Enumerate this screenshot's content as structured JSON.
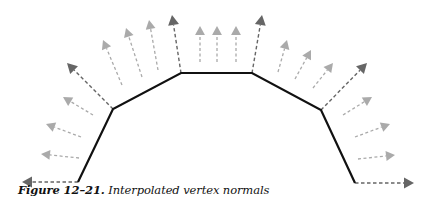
{
  "figure": {
    "caption_label": "Figure 12–21.",
    "caption_text": " Interpolated vertex normals",
    "colors": {
      "surface": "#111111",
      "vertex_normal": "#666666",
      "interpolated_normal": "#aaaaaa",
      "caption": "#111111"
    },
    "surface_vertices": [
      [
        78,
        182
      ],
      [
        113,
        109
      ],
      [
        181,
        73
      ],
      [
        252,
        73
      ],
      [
        321,
        110
      ],
      [
        355,
        183
      ]
    ],
    "vertex_normals": [
      {
        "from": [
          78,
          182
        ],
        "to": [
          22,
          182
        ]
      },
      {
        "from": [
          113,
          109
        ],
        "to": [
          67,
          63
        ]
      },
      {
        "from": [
          181,
          73
        ],
        "to": [
          172,
          15
        ]
      },
      {
        "from": [
          252,
          73
        ],
        "to": [
          262,
          15
        ]
      },
      {
        "from": [
          321,
          110
        ],
        "to": [
          367,
          63
        ]
      },
      {
        "from": [
          355,
          183
        ],
        "to": [
          414,
          183
        ]
      }
    ],
    "interpolated_normals": [
      {
        "from": [
          79,
          158
        ],
        "to": [
          41,
          154
        ]
      },
      {
        "from": [
          81,
          137
        ],
        "to": [
          46,
          124
        ]
      },
      {
        "from": [
          93,
          115
        ],
        "to": [
          63,
          97
        ]
      },
      {
        "from": [
          122,
          85
        ],
        "to": [
          103,
          40
        ]
      },
      {
        "from": [
          142,
          77
        ],
        "to": [
          126,
          28
        ]
      },
      {
        "from": [
          158,
          70
        ],
        "to": [
          149,
          20
        ]
      },
      {
        "from": [
          200,
          62
        ],
        "to": [
          200,
          26
        ]
      },
      {
        "from": [
          217,
          62
        ],
        "to": [
          217,
          26
        ]
      },
      {
        "from": [
          236,
          62
        ],
        "to": [
          236,
          26
        ]
      },
      {
        "from": [
          278,
          72
        ],
        "to": [
          287,
          40
        ]
      },
      {
        "from": [
          295,
          79
        ],
        "to": [
          311,
          50
        ]
      },
      {
        "from": [
          313,
          88
        ],
        "to": [
          333,
          63
        ]
      },
      {
        "from": [
          343,
          115
        ],
        "to": [
          372,
          97
        ]
      },
      {
        "from": [
          355,
          137
        ],
        "to": [
          390,
          124
        ]
      },
      {
        "from": [
          358,
          159
        ],
        "to": [
          395,
          155
        ]
      }
    ]
  }
}
